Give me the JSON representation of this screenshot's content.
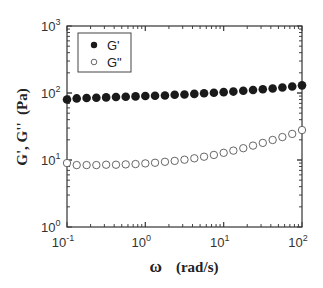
{
  "chart_data": {
    "type": "scatter",
    "title": "",
    "xlabel": "ω   (rad/s)",
    "ylabel": "G', G''  (Pa)",
    "xscale": "log",
    "yscale": "log",
    "xlim": [
      0.1,
      100
    ],
    "ylim": [
      1,
      1000
    ],
    "grid": false,
    "legend_position": "upper left",
    "x_ticks": [
      {
        "base": "10",
        "exp": "-1"
      },
      {
        "base": "10",
        "exp": "0"
      },
      {
        "base": "10",
        "exp": "1"
      },
      {
        "base": "10",
        "exp": "2"
      }
    ],
    "y_ticks": [
      {
        "base": "10",
        "exp": "0"
      },
      {
        "base": "10",
        "exp": "1"
      },
      {
        "base": "10",
        "exp": "2"
      },
      {
        "base": "10",
        "exp": "3"
      }
    ],
    "series": [
      {
        "name": "G'",
        "marker": "filled-circle",
        "color": "#1a1a1a",
        "x": [
          0.1,
          0.133,
          0.178,
          0.237,
          0.316,
          0.422,
          0.562,
          0.75,
          1.0,
          1.33,
          1.78,
          2.37,
          3.16,
          4.22,
          5.62,
          7.5,
          10,
          13.3,
          17.8,
          23.7,
          31.6,
          42.2,
          56.2,
          75,
          100
        ],
        "y": [
          80,
          83,
          84,
          85,
          86,
          87,
          88,
          89,
          90,
          91,
          92,
          94,
          95,
          97,
          99,
          101,
          103,
          105,
          108,
          111,
          114,
          117,
          121,
          125,
          130
        ]
      },
      {
        "name": "G''",
        "marker": "open-circle",
        "color": "#1a1a1a",
        "x": [
          0.1,
          0.133,
          0.178,
          0.237,
          0.316,
          0.422,
          0.562,
          0.75,
          1.0,
          1.33,
          1.78,
          2.37,
          3.16,
          4.22,
          5.62,
          7.5,
          10,
          13.3,
          17.8,
          23.7,
          31.6,
          42.2,
          56.2,
          75,
          100
        ],
        "y": [
          9.0,
          8.4,
          8.4,
          8.4,
          8.5,
          8.5,
          8.6,
          8.7,
          8.9,
          9.1,
          9.4,
          9.7,
          10.1,
          10.6,
          11.2,
          11.9,
          12.8,
          13.8,
          15.0,
          16.4,
          18.0,
          19.9,
          22.0,
          24.5,
          28.0
        ]
      }
    ]
  },
  "legend": {
    "items": [
      {
        "label": "G'",
        "marker": "filled"
      },
      {
        "label": "G\"",
        "marker": "open"
      }
    ]
  },
  "axes": {
    "x_title_symbol": "ω",
    "x_title_unit": "(rad/s)",
    "y_title": "G', G''  (Pa)"
  }
}
